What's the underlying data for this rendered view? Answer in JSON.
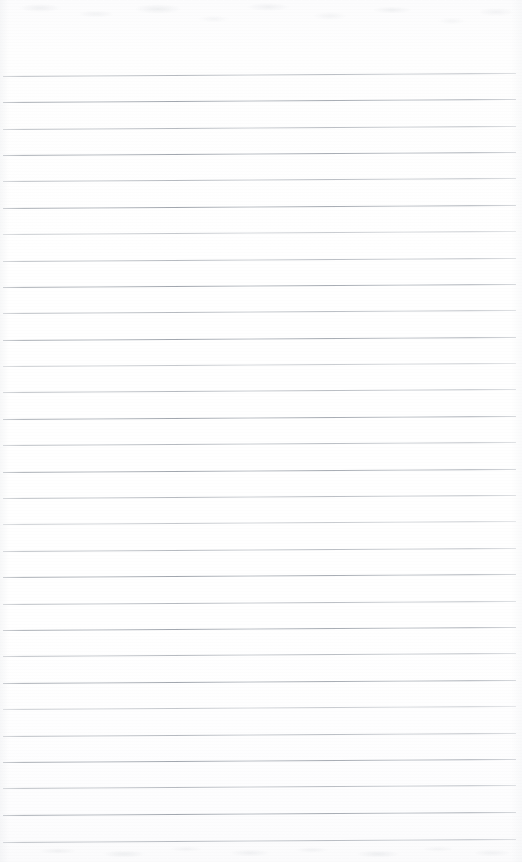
{
  "document": {
    "kind": "scanned-lined-notebook-page",
    "title": "Blank ruled notebook page",
    "orientation": "portrait",
    "width_px": 522,
    "height_px": 862,
    "content_text": "",
    "is_blank": true
  },
  "paper": {
    "background_color": "#fdfdfd",
    "highlight_color": "#ffffff",
    "shadow_color": "#e4e6e9",
    "top_margin_px": 76,
    "bottom_margin_px": 20,
    "left_inset_px": 3,
    "right_inset_px": 6
  },
  "ruling": {
    "line_color": "#969ca4",
    "line_color_light": "#b0b5bc",
    "line_thickness_px": 1,
    "line_count": 30,
    "first_line_y_px": 76,
    "last_line_y_px": 842,
    "spacing_px": 26.4,
    "skew_degrees": -0.34,
    "line_start_x_px": 3,
    "line_length_px": 513,
    "lines": [
      {
        "index": 1,
        "y": 76,
        "weight": "lighter"
      },
      {
        "index": 2,
        "y": 102,
        "weight": "strong"
      },
      {
        "index": 3,
        "y": 129,
        "weight": "lighter"
      },
      {
        "index": 4,
        "y": 155,
        "weight": "strong"
      },
      {
        "index": 5,
        "y": 181,
        "weight": "lighter"
      },
      {
        "index": 6,
        "y": 208,
        "weight": "strong"
      },
      {
        "index": 7,
        "y": 234,
        "weight": "faint"
      },
      {
        "index": 8,
        "y": 261,
        "weight": "lighter"
      },
      {
        "index": 9,
        "y": 287,
        "weight": "strong"
      },
      {
        "index": 10,
        "y": 313,
        "weight": "lighter"
      },
      {
        "index": 11,
        "y": 340,
        "weight": "strong"
      },
      {
        "index": 12,
        "y": 366,
        "weight": "faint"
      },
      {
        "index": 13,
        "y": 392,
        "weight": "lighter"
      },
      {
        "index": 14,
        "y": 419,
        "weight": "strong"
      },
      {
        "index": 15,
        "y": 445,
        "weight": "lighter"
      },
      {
        "index": 16,
        "y": 472,
        "weight": "strong"
      },
      {
        "index": 17,
        "y": 498,
        "weight": "lighter"
      },
      {
        "index": 18,
        "y": 524,
        "weight": "faint"
      },
      {
        "index": 19,
        "y": 551,
        "weight": "lighter"
      },
      {
        "index": 20,
        "y": 577,
        "weight": "strong"
      },
      {
        "index": 21,
        "y": 604,
        "weight": "lighter"
      },
      {
        "index": 22,
        "y": 630,
        "weight": "strong"
      },
      {
        "index": 23,
        "y": 656,
        "weight": "lighter"
      },
      {
        "index": 24,
        "y": 683,
        "weight": "strong"
      },
      {
        "index": 25,
        "y": 709,
        "weight": "faint"
      },
      {
        "index": 26,
        "y": 736,
        "weight": "lighter"
      },
      {
        "index": 27,
        "y": 762,
        "weight": "strong"
      },
      {
        "index": 28,
        "y": 788,
        "weight": "lighter"
      },
      {
        "index": 29,
        "y": 815,
        "weight": "strong"
      },
      {
        "index": 30,
        "y": 842,
        "weight": "lighter"
      }
    ]
  },
  "artifacts": {
    "top_bleed_through": {
      "present": true,
      "top_px": 0,
      "height_px": 44,
      "description": "faint ghost of writing from the reverse side"
    },
    "bottom_bleed_through": {
      "present": true,
      "height_px": 20,
      "description": "faint ghost of writing from the reverse side"
    },
    "scan_grain": {
      "present": true
    }
  }
}
